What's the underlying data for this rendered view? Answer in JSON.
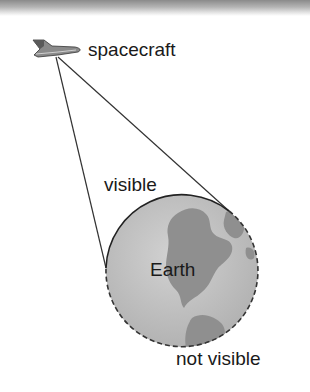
{
  "diagram": {
    "labels": {
      "spacecraft": "spacecraft",
      "visible": "visible",
      "earth": "Earth",
      "not_visible": "not visible"
    },
    "colors": {
      "ocean": "#c4c4c4",
      "land": "#8e8e8e",
      "outline": "#222222",
      "lines": "#333333"
    }
  }
}
